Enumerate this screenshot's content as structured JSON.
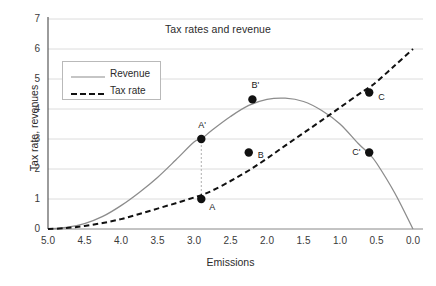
{
  "chart_data": {
    "type": "line",
    "title": "Tax rates and revenue",
    "xlabel": "Emissions",
    "ylabel": "Tax rate, revenues",
    "xlim": [
      5.0,
      0.0
    ],
    "ylim": [
      0,
      7
    ],
    "x_reversed": true,
    "grid": "horizontal",
    "legend_position": "top-left-inside",
    "xticks": [
      "5.0",
      "4.5",
      "4.0",
      "3.5",
      "3.0",
      "2.5",
      "2.0",
      "1.5",
      "1.0",
      "0.5",
      "0.0"
    ],
    "xtick_values": [
      5.0,
      4.5,
      4.0,
      3.5,
      3.0,
      2.5,
      2.0,
      1.5,
      1.0,
      0.5,
      0.0
    ],
    "yticks": [
      "0",
      "1",
      "2",
      "3",
      "4",
      "5",
      "6",
      "7"
    ],
    "ytick_values": [
      0,
      1,
      2,
      3,
      4,
      5,
      6,
      7
    ],
    "series": [
      {
        "name": "Revenue",
        "style": "solid",
        "color": "#8c8c8c",
        "x": [
          5.0,
          4.75,
          4.5,
          4.25,
          4.0,
          3.75,
          3.5,
          3.25,
          3.0,
          2.9,
          2.75,
          2.5,
          2.25,
          2.0,
          1.75,
          1.5,
          1.25,
          1.0,
          0.75,
          0.6,
          0.5,
          0.25,
          0.0
        ],
        "values": [
          0.0,
          0.05,
          0.18,
          0.42,
          0.78,
          1.22,
          1.72,
          2.3,
          2.9,
          3.0,
          3.3,
          3.75,
          4.12,
          4.32,
          4.36,
          4.25,
          3.95,
          3.5,
          2.85,
          2.5,
          2.2,
          1.2,
          0.0
        ]
      },
      {
        "name": "Tax rate",
        "style": "dashed",
        "color": "#111111",
        "x": [
          5.0,
          4.75,
          4.5,
          4.25,
          4.0,
          3.75,
          3.5,
          3.25,
          3.0,
          2.9,
          2.75,
          2.5,
          2.25,
          2.0,
          1.75,
          1.5,
          1.25,
          1.0,
          0.75,
          0.6,
          0.5,
          0.25,
          0.0
        ],
        "values": [
          0.0,
          0.03,
          0.1,
          0.2,
          0.33,
          0.5,
          0.68,
          0.86,
          1.05,
          1.13,
          1.28,
          1.6,
          1.95,
          2.35,
          2.78,
          3.2,
          3.62,
          4.05,
          4.48,
          4.72,
          4.9,
          5.45,
          6.0
        ]
      }
    ],
    "annotations": [
      {
        "label": "A",
        "x": 2.9,
        "y": 1.0,
        "series": "Tax rate",
        "label_dx": 8,
        "label_dy": 9
      },
      {
        "label": "A'",
        "x": 2.9,
        "y": 3.0,
        "series": "Revenue",
        "label_dx": -3,
        "label_dy": -13
      },
      {
        "label": "B",
        "x": 2.25,
        "y": 2.55,
        "series": "Tax rate",
        "label_dx": 9,
        "label_dy": 3
      },
      {
        "label": "B'",
        "x": 2.2,
        "y": 4.32,
        "series": "Revenue",
        "label_dx": -1,
        "label_dy": -13
      },
      {
        "label": "C",
        "x": 0.6,
        "y": 4.55,
        "series": "Tax rate",
        "label_dx": 9,
        "label_dy": 5
      },
      {
        "label": "C'",
        "x": 0.6,
        "y": 2.55,
        "series": "Revenue",
        "label_dx": -17,
        "label_dy": 0
      }
    ],
    "connector": {
      "from": "A",
      "to": "A'",
      "x": 2.9,
      "y_low": 1.0,
      "y_high": 3.0,
      "style": "dotted"
    }
  },
  "legend": {
    "items": [
      {
        "label": "Revenue",
        "style": "solid",
        "color": "#8c8c8c"
      },
      {
        "label": "Tax rate",
        "style": "dashed",
        "color": "#111111"
      }
    ]
  }
}
